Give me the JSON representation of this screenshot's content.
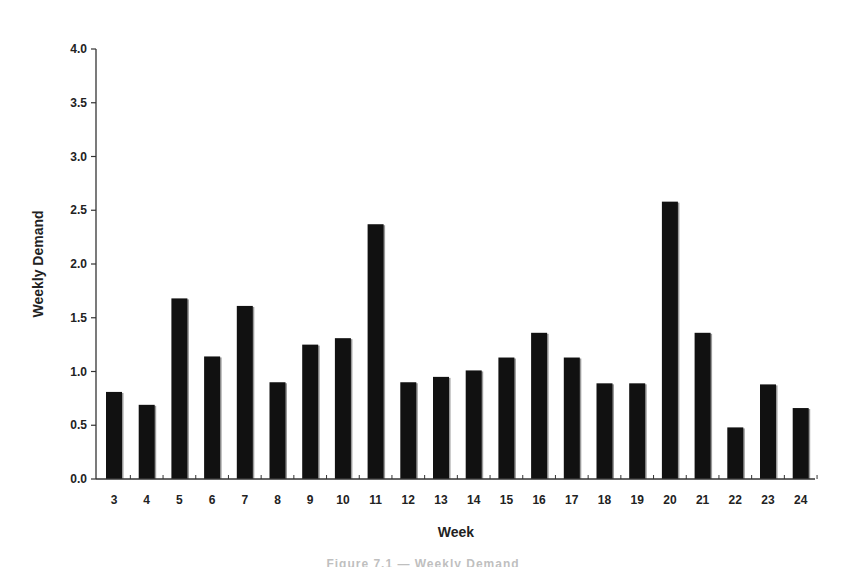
{
  "chart_data": {
    "type": "bar",
    "title": "",
    "xlabel": "Week",
    "ylabel": "Weekly Demand",
    "ylim": [
      0,
      4.0
    ],
    "yticks": [
      "0.0",
      "0.5",
      "1.0",
      "1.5",
      "2.0",
      "2.5",
      "3.0",
      "3.5",
      "4.0"
    ],
    "grid": false,
    "legend": null,
    "categories": [
      "3",
      "4",
      "5",
      "6",
      "7",
      "8",
      "9",
      "10",
      "11",
      "12",
      "13",
      "14",
      "15",
      "16",
      "17",
      "18",
      "19",
      "20",
      "21",
      "22",
      "23",
      "24"
    ],
    "values": [
      0.81,
      0.69,
      1.68,
      1.14,
      1.61,
      0.9,
      1.25,
      1.31,
      2.37,
      0.9,
      0.95,
      1.01,
      1.13,
      1.36,
      1.13,
      0.89,
      0.89,
      2.58,
      1.36,
      0.48,
      0.88,
      0.66
    ],
    "bar_color": "#111111"
  },
  "caption": "Figure 7.1 — Weekly Demand"
}
